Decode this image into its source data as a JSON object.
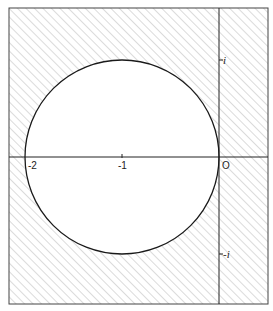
{
  "diagram": {
    "title": "",
    "circle": {
      "center": {
        "re": -1,
        "im": 0
      },
      "radius": 1
    },
    "shaded_region": "outside circle",
    "hatch_color": "#b8b8b8",
    "line_color": "#222222",
    "real_axis_ticks": [
      {
        "value": -2,
        "label": "-2"
      },
      {
        "value": -1,
        "label": "-1"
      },
      {
        "value": 0,
        "label": "O"
      }
    ],
    "imag_axis_ticks": [
      {
        "value": 1,
        "label": "i"
      },
      {
        "value": -1,
        "label": "-i"
      }
    ]
  }
}
